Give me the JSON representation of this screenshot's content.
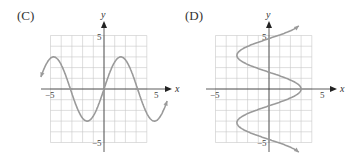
{
  "panels": [
    {
      "label": "(C)",
      "x_axis": "x",
      "y_axis": "y",
      "tick_pos": "5",
      "tick_neg": "−5"
    },
    {
      "label": "(D)",
      "x_axis": "x",
      "y_axis": "y",
      "tick_pos": "5",
      "tick_neg": "−5"
    }
  ],
  "colors": {
    "grid": "#c8c8c8",
    "axis": "#333333",
    "curve": "#9a9a9a"
  },
  "chart_data": [
    {
      "type": "line",
      "title": "(C)",
      "xlabel": "x",
      "ylabel": "y",
      "xlim": [
        -5,
        5
      ],
      "ylim": [
        -5,
        5
      ],
      "grid": true,
      "description": "y = 3 sin(x), drawn for x in about [-5.9, 5.9] with arrowheads at both ends",
      "x": [
        -5.9,
        -4.71,
        -3.14,
        -1.57,
        0,
        1.57,
        3.14,
        4.71,
        5.9
      ],
      "y": [
        1.1,
        3,
        0,
        -3,
        0,
        3,
        0,
        -3,
        -1.1
      ]
    },
    {
      "type": "line",
      "title": "(D)",
      "xlabel": "x",
      "ylabel": "y",
      "xlim": [
        -5,
        5
      ],
      "ylim": [
        -5,
        5
      ],
      "grid": true,
      "description": "x = 3 cos(y), drawn for y in about [-5.9, 5.9] with arrowheads at both ends",
      "x": [
        2.2,
        0,
        -3,
        0,
        3,
        0,
        -3,
        0,
        2.2
      ],
      "y": [
        -5.9,
        -4.71,
        -3.14,
        -1.57,
        0,
        1.57,
        3.14,
        4.71,
        5.9
      ]
    }
  ]
}
